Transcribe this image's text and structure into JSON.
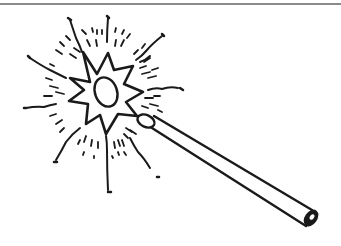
{
  "illustration": {
    "subject": "magic wand with sparkling star",
    "colors": {
      "ink": "#1a1a1a",
      "rule": "#8a8a8a",
      "background": "#ffffff"
    }
  }
}
